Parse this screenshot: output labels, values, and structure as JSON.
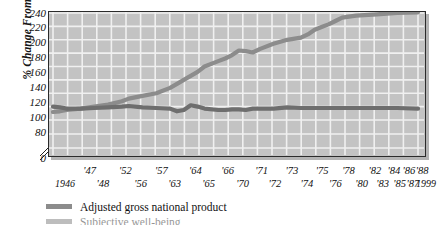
{
  "figure": {
    "top_fragment": "",
    "background": "#ffffff",
    "plot_background": "#c3c3c3",
    "gridline_color": "#f2f2f2",
    "frame_color": "#2b2b2b"
  },
  "axes": {
    "y_title": "% Change From 1946",
    "y_ticks": [
      "240",
      "220",
      "200",
      "180",
      "160",
      "140",
      "120",
      "100",
      "80",
      "0"
    ],
    "y_has_break": true,
    "x_ticks_upper": [
      "'47",
      "'52",
      "'57",
      "'64",
      "'66",
      "'71",
      "'73",
      "'75",
      "'78",
      "'82",
      "'84",
      "'86",
      "'88"
    ],
    "x_ticks_lower": [
      "1946",
      "'48",
      "'56",
      "'63",
      "'65",
      "'70",
      "'72",
      "'74",
      "'76",
      "'80",
      "'83",
      "'85",
      "'87",
      "1999"
    ]
  },
  "legend": {
    "items": [
      {
        "label": "Adjusted gross national product",
        "color": "#8c8c8c"
      },
      {
        "label": "Subjective well-being",
        "color": "#6e6e6e"
      }
    ]
  },
  "chart_data": {
    "type": "line",
    "title": "",
    "xlabel": "",
    "ylabel": "% Change From 1946",
    "ylim": [
      80,
      240
    ],
    "xlim": [
      1946,
      1999
    ],
    "grid": true,
    "legend_position": "below",
    "axis_break": {
      "between": [
        0,
        80
      ]
    },
    "x": [
      1946,
      1947,
      1948,
      1950,
      1952,
      1954,
      1956,
      1957,
      1959,
      1961,
      1963,
      1964,
      1965,
      1966,
      1967,
      1968,
      1970,
      1971,
      1972,
      1973,
      1974,
      1975,
      1976,
      1978,
      1980,
      1982,
      1983,
      1984,
      1985,
      1986,
      1987,
      1988,
      1990,
      1993,
      1996,
      1999
    ],
    "series": [
      {
        "name": "Adjusted gross national product",
        "color": "#8c8c8c",
        "values": [
          92,
          93,
          95,
          97,
          100,
          103,
          108,
          112,
          116,
          120,
          128,
          134,
          140,
          146,
          152,
          160,
          168,
          172,
          177,
          184,
          183,
          181,
          186,
          194,
          200,
          203,
          208,
          215,
          219,
          223,
          228,
          233,
          236,
          238,
          240,
          241
        ]
      },
      {
        "name": "Subjective well-being",
        "color": "#6e6e6e",
        "values": [
          100,
          99,
          97,
          97,
          98,
          99,
          100,
          101,
          99,
          98,
          97,
          93,
          95,
          102,
          100,
          97,
          95,
          95,
          96,
          96,
          95,
          97,
          97,
          97,
          99,
          98,
          98,
          98,
          98,
          98,
          98,
          98,
          98,
          98,
          98,
          97
        ]
      }
    ]
  }
}
